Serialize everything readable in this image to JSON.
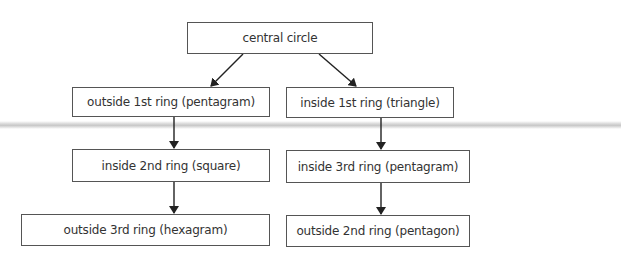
{
  "diagram": {
    "type": "flowchart",
    "nodes": [
      {
        "id": "central",
        "label": "central circle"
      },
      {
        "id": "outside1",
        "label": "outside 1st ring (pentagram)"
      },
      {
        "id": "inside1",
        "label": "inside 1st ring (triangle)"
      },
      {
        "id": "inside2",
        "label": "inside 2nd ring (square)"
      },
      {
        "id": "inside3",
        "label": "inside 3rd ring (pentagram)"
      },
      {
        "id": "outside3",
        "label": "outside 3rd ring (hexagram)"
      },
      {
        "id": "outside2",
        "label": "outside 2nd ring (pentagon)"
      }
    ],
    "edges": [
      {
        "from": "central",
        "to": "outside1"
      },
      {
        "from": "central",
        "to": "inside1"
      },
      {
        "from": "outside1",
        "to": "inside2"
      },
      {
        "from": "inside2",
        "to": "outside3"
      },
      {
        "from": "inside1",
        "to": "inside3"
      },
      {
        "from": "inside3",
        "to": "outside2"
      }
    ],
    "colors": {
      "border": "#555555",
      "text": "#333333",
      "arrow": "#222222"
    }
  }
}
